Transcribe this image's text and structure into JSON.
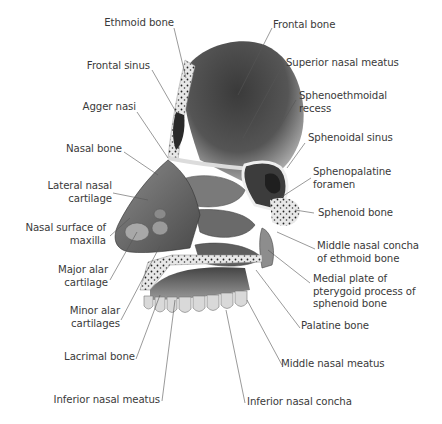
{
  "diagram": {
    "colors": {
      "label_text": "#3a3a3a",
      "leader_line": "#555555",
      "bone_light": "#e6e6e6",
      "bone_dark": "#2b2b2b"
    },
    "labels_left": [
      {
        "id": "ethmoid-bone",
        "text": "Ethmoid bone"
      },
      {
        "id": "frontal-sinus",
        "text": "Frontal sinus"
      },
      {
        "id": "agger-nasi",
        "text": "Agger nasi"
      },
      {
        "id": "nasal-bone",
        "text": "Nasal bone"
      },
      {
        "id": "lateral-nasal-cartilage",
        "text": "Lateral nasal\ncartilage"
      },
      {
        "id": "nasal-surface-maxilla",
        "text": "Nasal surface of\nmaxilla"
      },
      {
        "id": "major-alar-cartilage",
        "text": "Major alar\ncartilage"
      },
      {
        "id": "minor-alar-cartilages",
        "text": "Minor alar\ncartilages"
      },
      {
        "id": "lacrimal-bone",
        "text": "Lacrimal bone"
      },
      {
        "id": "inferior-nasal-meatus",
        "text": "Inferior nasal meatus"
      }
    ],
    "labels_right": [
      {
        "id": "frontal-bone",
        "text": "Frontal bone"
      },
      {
        "id": "superior-nasal-meatus",
        "text": "Superior nasal meatus"
      },
      {
        "id": "sphenoethmoidal-recess",
        "text": "Sphenoethmoidal\nrecess"
      },
      {
        "id": "sphenoidal-sinus",
        "text": "Sphenoidal sinus"
      },
      {
        "id": "sphenopalatine-foramen",
        "text": "Sphenopalatine\nforamen"
      },
      {
        "id": "sphenoid-bone",
        "text": "Sphenoid bone"
      },
      {
        "id": "middle-nasal-concha",
        "text": "Middle nasal concha\nof ethmoid bone"
      },
      {
        "id": "medial-plate-pterygoid",
        "text": "Medial plate of\npterygoid process of\nsphenoid bone"
      },
      {
        "id": "palatine-bone",
        "text": "Palatine bone"
      },
      {
        "id": "middle-nasal-meatus",
        "text": "Middle nasal meatus"
      },
      {
        "id": "inferior-nasal-concha",
        "text": "Inferior nasal concha"
      }
    ]
  }
}
